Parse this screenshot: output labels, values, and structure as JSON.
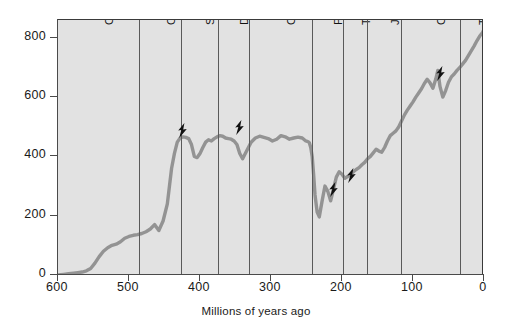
{
  "chart_data": {
    "type": "line",
    "title": "",
    "xlabel": "Millions of years ago",
    "ylabel": "",
    "xlim": [
      600,
      0
    ],
    "ylim": [
      0,
      860
    ],
    "x_ticks": [
      600,
      500,
      400,
      300,
      200,
      100,
      0
    ],
    "y_ticks": [
      0,
      200,
      400,
      600,
      800
    ],
    "x_reversed": true,
    "grid": false,
    "legend": "none",
    "series": [
      {
        "name": "Number of families",
        "x": [
          600,
          592,
          585,
          578,
          572,
          566,
          560,
          554,
          548,
          542,
          536,
          530,
          524,
          518,
          512,
          506,
          500,
          494,
          488,
          482,
          476,
          470,
          464,
          458,
          452,
          446,
          443,
          440,
          436,
          432,
          428,
          424,
          420,
          416,
          412,
          408,
          404,
          400,
          396,
          392,
          388,
          384,
          380,
          376,
          372,
          368,
          364,
          360,
          356,
          352,
          348,
          344,
          340,
          334,
          328,
          322,
          316,
          310,
          304,
          298,
          292,
          286,
          280,
          274,
          268,
          262,
          256,
          251,
          248,
          246,
          244,
          242,
          240,
          238,
          235,
          232,
          228,
          224,
          220,
          216,
          212,
          208,
          204,
          200,
          196,
          192,
          188,
          184,
          180,
          176,
          172,
          168,
          164,
          160,
          156,
          152,
          148,
          144,
          140,
          136,
          132,
          128,
          124,
          120,
          116,
          112,
          108,
          104,
          100,
          96,
          92,
          88,
          84,
          80,
          76,
          72,
          68,
          65,
          62,
          58,
          54,
          50,
          46,
          42,
          38,
          34,
          30,
          26,
          22,
          18,
          14,
          10,
          6,
          2,
          0
        ],
        "y": [
          0,
          2,
          4,
          6,
          8,
          10,
          14,
          22,
          40,
          62,
          80,
          92,
          100,
          104,
          112,
          124,
          130,
          134,
          136,
          140,
          146,
          155,
          170,
          150,
          182,
          240,
          300,
          360,
          410,
          448,
          462,
          466,
          464,
          460,
          440,
          400,
          396,
          410,
          430,
          448,
          456,
          452,
          460,
          466,
          470,
          468,
          462,
          460,
          458,
          452,
          440,
          410,
          392,
          420,
          448,
          462,
          468,
          464,
          460,
          452,
          458,
          470,
          466,
          458,
          462,
          465,
          462,
          452,
          450,
          446,
          430,
          400,
          340,
          270,
          212,
          196,
          250,
          300,
          282,
          250,
          290,
          330,
          348,
          340,
          326,
          332,
          340,
          348,
          356,
          362,
          372,
          380,
          392,
          400,
          412,
          424,
          418,
          414,
          430,
          452,
          470,
          478,
          486,
          500,
          520,
          540,
          556,
          570,
          584,
          600,
          614,
          628,
          646,
          660,
          648,
          630,
          660,
          690,
          636,
          600,
          622,
          650,
          668,
          678,
          690,
          700,
          712,
          724,
          740,
          756,
          772,
          790,
          806,
          818,
          828
        ]
      }
    ],
    "periods": [
      {
        "name": "Cambrian",
        "start": 600,
        "end": 486
      },
      {
        "name": "Ordovician",
        "start": 486,
        "end": 427
      },
      {
        "name": "Silurian",
        "start": 427,
        "end": 375
      },
      {
        "name": "Devonian",
        "start": 375,
        "end": 331
      },
      {
        "name": "Carboniferous",
        "start": 331,
        "end": 243
      },
      {
        "name": "Permian",
        "start": 243,
        "end": 198
      },
      {
        "name": "Triassic",
        "start": 198,
        "end": 165
      },
      {
        "name": "Jurassic",
        "start": 165,
        "end": 117
      },
      {
        "name": "Cretaceous",
        "start": 117,
        "end": 34
      },
      {
        "name": "Tertiary",
        "start": 34,
        "end": 0
      }
    ],
    "extinction_events": [
      {
        "label": "end-Ordovician",
        "x": 425,
        "y": 470
      },
      {
        "label": "late-Devonian",
        "x": 345,
        "y": 480
      },
      {
        "label": "end-Permian",
        "x": 212,
        "y": 270
      },
      {
        "label": "end-Triassic",
        "x": 188,
        "y": 318
      },
      {
        "label": "end-Cretaceous",
        "x": 62,
        "y": 660
      }
    ],
    "colors": {
      "plot_background": "#e2e2e2",
      "curve": "#939393",
      "axis": "#4a4a4a",
      "divider": "#5a5a5a",
      "bolt": "#111111",
      "text": "#1a1a1a"
    }
  }
}
